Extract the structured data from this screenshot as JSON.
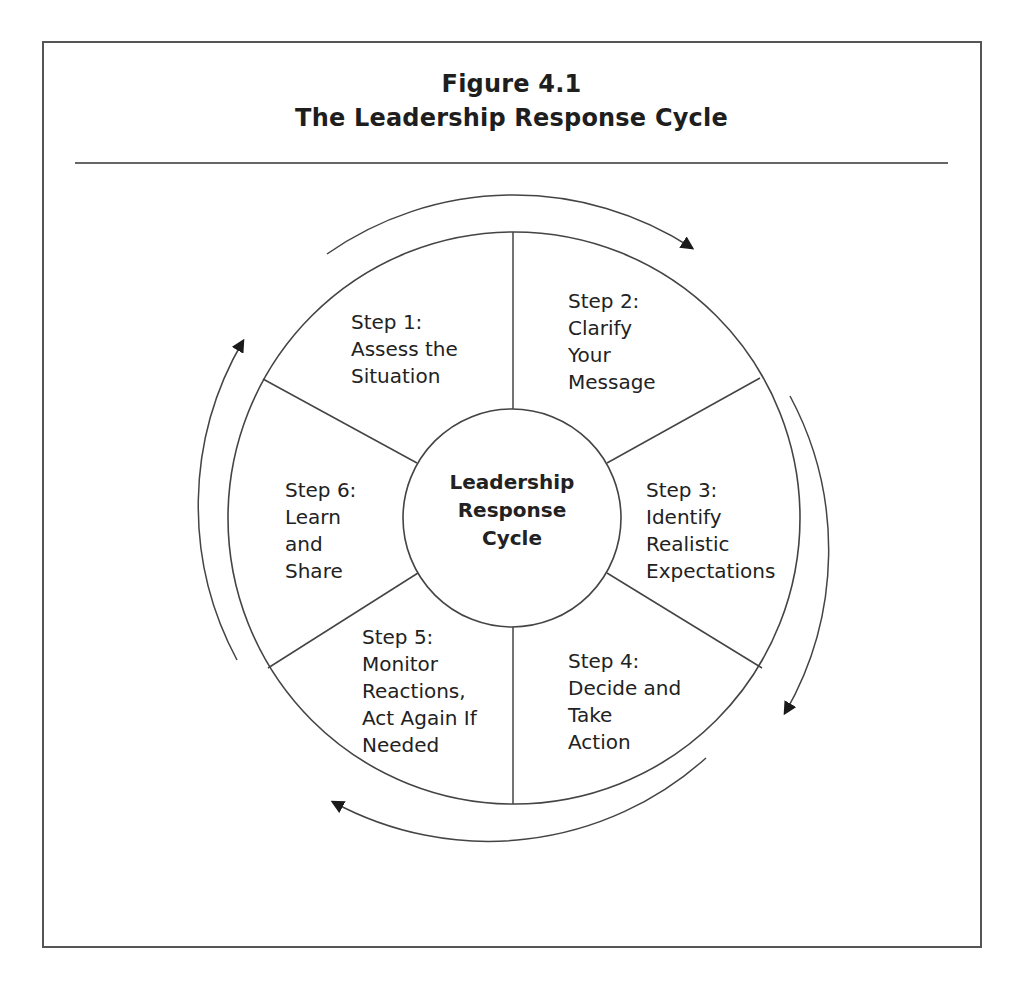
{
  "figure": {
    "number": "Figure 4.1",
    "title": "The Leadership Response Cycle"
  },
  "center": {
    "lines": [
      "Leadership",
      "Response",
      "Cycle"
    ]
  },
  "steps": [
    {
      "id": 1,
      "lines": [
        "Step 1:",
        "Assess the",
        "Situation"
      ]
    },
    {
      "id": 2,
      "lines": [
        "Step 2:",
        "Clarify",
        "Your",
        "Message"
      ]
    },
    {
      "id": 3,
      "lines": [
        "Step 3:",
        "Identify",
        "Realistic",
        "Expectations"
      ]
    },
    {
      "id": 4,
      "lines": [
        "Step 4:",
        "Decide and",
        "Take",
        "Action"
      ]
    },
    {
      "id": 5,
      "lines": [
        "Step 5:",
        "Monitor",
        "Reactions,",
        "Act Again If",
        "Needed"
      ]
    },
    {
      "id": 6,
      "lines": [
        "Step 6:",
        "Learn",
        "and",
        "Share"
      ]
    }
  ],
  "arrows": {
    "direction": "clockwise",
    "count": 4
  },
  "colors": {
    "line": "#444444",
    "text": "#222222",
    "background": "#ffffff"
  }
}
